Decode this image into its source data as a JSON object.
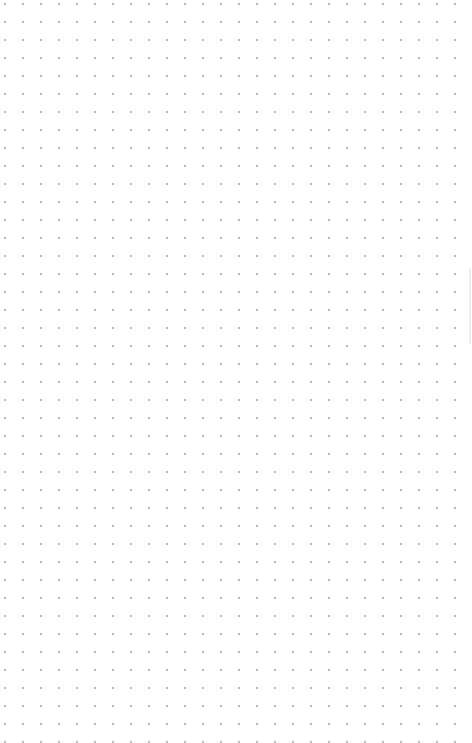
{
  "canvas": {
    "type": "dot-grid",
    "background_color": "#ffffff",
    "dot_color": "#b8b8b8",
    "dot_spacing_px": 18,
    "content": []
  },
  "scrollbar": {
    "orientation": "vertical",
    "thumb_color": "#ececec"
  }
}
